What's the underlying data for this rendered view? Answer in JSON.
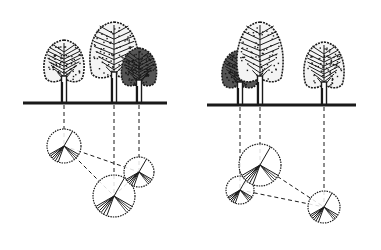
{
  "diagram": {
    "title": "",
    "colors": {
      "ink": "#1a1a1a",
      "background": "#ffffff",
      "dark_crown": "#2a2a2a"
    },
    "panels": [
      {
        "id": "left",
        "ground": {
          "x1": 23,
          "x2": 167,
          "y": 103
        },
        "trees": [
          {
            "id": "L1",
            "x": 64,
            "crown_top": 40,
            "crown_w": 40,
            "crown_bottom": 82,
            "dark": false
          },
          {
            "id": "L2",
            "x": 114,
            "crown_top": 22,
            "crown_w": 48,
            "crown_bottom": 78,
            "dark": false
          },
          {
            "id": "L3",
            "x": 139,
            "crown_top": 48,
            "crown_w": 35,
            "crown_bottom": 86,
            "dark": true
          }
        ],
        "plan_circles": [
          {
            "tree": "L1",
            "cx": 64,
            "cy": 146,
            "r": 17
          },
          {
            "tree": "L2",
            "cx": 114,
            "cy": 196,
            "r": 21
          },
          {
            "tree": "L3",
            "cx": 139,
            "cy": 172,
            "r": 15
          }
        ],
        "connections": [
          [
            "L1",
            "L2"
          ],
          [
            "L1",
            "L3"
          ],
          [
            "L2",
            "L3"
          ]
        ]
      },
      {
        "id": "right",
        "ground": {
          "x1": 207,
          "x2": 356,
          "y": 105
        },
        "trees": [
          {
            "id": "R1",
            "x": 240,
            "crown_top": 50,
            "crown_w": 36,
            "crown_bottom": 88,
            "dark": true
          },
          {
            "id": "R2",
            "x": 260,
            "crown_top": 22,
            "crown_w": 46,
            "crown_bottom": 82,
            "dark": false
          },
          {
            "id": "R3",
            "x": 324,
            "crown_top": 42,
            "crown_w": 40,
            "crown_bottom": 88,
            "dark": false
          }
        ],
        "plan_circles": [
          {
            "tree": "R1",
            "cx": 240,
            "cy": 190,
            "r": 14
          },
          {
            "tree": "R2",
            "cx": 260,
            "cy": 165,
            "r": 21
          },
          {
            "tree": "R3",
            "cx": 324,
            "cy": 207,
            "r": 16
          }
        ],
        "connections": [
          [
            "R1",
            "R2"
          ],
          [
            "R2",
            "R3"
          ],
          [
            "R1",
            "R3"
          ]
        ]
      }
    ]
  }
}
